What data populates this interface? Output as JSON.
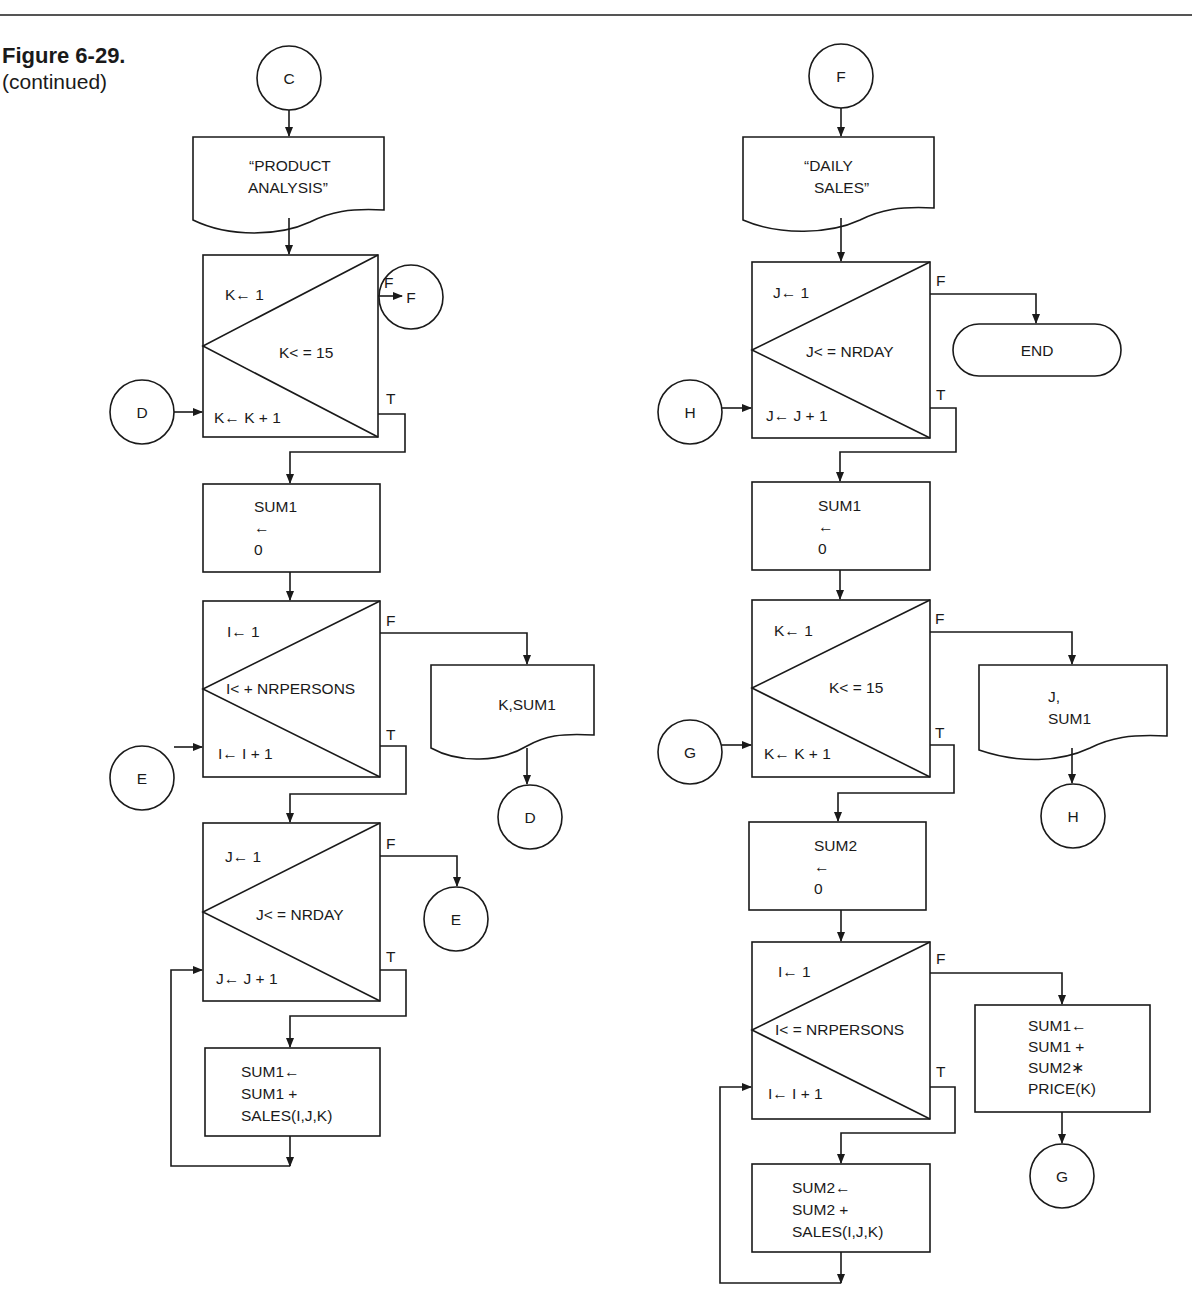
{
  "figure": {
    "title": "Figure 6-29.",
    "subtitle": "(continued)"
  },
  "left_flow": {
    "entry_connector": "C",
    "header_doc": [
      "“PRODUCT",
      "ANALYSIS”"
    ],
    "loop_k": {
      "init": "K← 1",
      "test": "K< = 15",
      "incr": "K← K + 1",
      "false_label": "F",
      "true_label": "T",
      "false_connector": "F",
      "entry_connector": "D"
    },
    "init_sum1": [
      "SUM1",
      "←",
      "0"
    ],
    "loop_i": {
      "init": "I← 1",
      "test": "I< + NRPERSONS",
      "incr": "I← I + 1",
      "false_label": "F",
      "true_label": "T",
      "entry_connector": "E"
    },
    "output_doc": [
      "K,SUM1"
    ],
    "output_connector": "D",
    "loop_j": {
      "init": "J← 1",
      "test": "J< = NRDAY",
      "incr": "J← J + 1",
      "false_label": "F",
      "true_label": "T",
      "false_connector": "E"
    },
    "accumulate": [
      "SUM1←",
      "SUM1 +",
      "SALES(I,J,K)"
    ]
  },
  "right_flow": {
    "entry_connector": "F",
    "header_doc": [
      "“DAILY",
      "SALES”"
    ],
    "loop_j": {
      "init": "J← 1",
      "test": "J< = NRDAY",
      "incr": "J← J + 1",
      "false_label": "F",
      "true_label": "T",
      "entry_connector": "H"
    },
    "terminal": "END",
    "init_sum1": [
      "SUM1",
      "←",
      "0"
    ],
    "loop_k": {
      "init": "K← 1",
      "test": "K< = 15",
      "incr": "K← K + 1",
      "false_label": "F",
      "true_label": "T",
      "entry_connector": "G"
    },
    "output_doc": [
      "J,",
      "SUM1"
    ],
    "output_connector": "H",
    "init_sum2": [
      "SUM2",
      "←",
      "0"
    ],
    "loop_i": {
      "init": "I← 1",
      "test": "I< = NRPERSONS",
      "incr": "I← I + 1",
      "false_label": "F",
      "true_label": "T"
    },
    "price_box": [
      "SUM1←",
      "SUM1 +",
      "SUM2∗",
      "PRICE(K)"
    ],
    "price_connector": "G",
    "accumulate": [
      "SUM2←",
      "SUM2 +",
      "SALES(I,J,K)"
    ]
  }
}
